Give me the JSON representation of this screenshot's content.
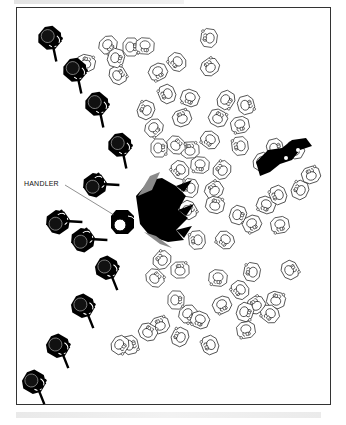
{
  "figure": {
    "labels": {
      "handler": "HANDLER"
    },
    "frame": {
      "stroke": "#333333",
      "background": "#ffffff"
    },
    "colors": {
      "officer_fill": "#000000",
      "crowd_stroke": "#222222",
      "dog_shadow": "#8a8a8a"
    },
    "officers": [
      {
        "x": 50,
        "y": 38,
        "a": 40
      },
      {
        "x": 75,
        "y": 70,
        "a": 40
      },
      {
        "x": 97,
        "y": 104,
        "a": 40
      },
      {
        "x": 120,
        "y": 145,
        "a": 40
      },
      {
        "x": 95,
        "y": 185,
        "a": -35
      },
      {
        "x": 58,
        "y": 222,
        "a": -35
      },
      {
        "x": 83,
        "y": 240,
        "a": -35
      },
      {
        "x": 107,
        "y": 268,
        "a": 30
      },
      {
        "x": 83,
        "y": 306,
        "a": 30
      },
      {
        "x": 58,
        "y": 346,
        "a": 30
      },
      {
        "x": 34,
        "y": 382,
        "a": 30
      }
    ],
    "handler": {
      "x": 122,
      "y": 222
    },
    "crowd": [
      [
        131,
        47
      ],
      [
        108,
        45
      ],
      [
        145,
        46
      ],
      [
        177,
        62
      ],
      [
        209,
        38
      ],
      [
        210,
        67
      ],
      [
        86,
        63
      ],
      [
        118,
        75
      ],
      [
        116,
        58
      ],
      [
        158,
        72
      ],
      [
        190,
        98
      ],
      [
        167,
        94
      ],
      [
        146,
        110
      ],
      [
        182,
        118
      ],
      [
        218,
        118
      ],
      [
        246,
        105
      ],
      [
        226,
        100
      ],
      [
        240,
        125
      ],
      [
        210,
        140
      ],
      [
        240,
        146
      ],
      [
        222,
        170
      ],
      [
        190,
        150
      ],
      [
        176,
        145
      ],
      [
        159,
        148
      ],
      [
        154,
        128
      ],
      [
        200,
        165
      ],
      [
        180,
        170
      ],
      [
        190,
        188
      ],
      [
        214,
        190
      ],
      [
        215,
        205
      ],
      [
        188,
        210
      ],
      [
        238,
        215
      ],
      [
        252,
        224
      ],
      [
        266,
        205
      ],
      [
        278,
        195
      ],
      [
        300,
        190
      ],
      [
        311,
        175
      ],
      [
        295,
        150
      ],
      [
        275,
        148
      ],
      [
        262,
        162
      ],
      [
        280,
        225
      ],
      [
        225,
        240
      ],
      [
        197,
        240
      ],
      [
        162,
        260
      ],
      [
        180,
        270
      ],
      [
        155,
        278
      ],
      [
        176,
        300
      ],
      [
        188,
        314
      ],
      [
        218,
        278
      ],
      [
        240,
        290
      ],
      [
        252,
        272
      ],
      [
        256,
        305
      ],
      [
        276,
        300
      ],
      [
        290,
        270
      ],
      [
        245,
        312
      ],
      [
        222,
        305
      ],
      [
        200,
        320
      ],
      [
        210,
        345
      ],
      [
        180,
        337
      ],
      [
        160,
        325
      ],
      [
        148,
        332
      ],
      [
        130,
        345
      ],
      [
        120,
        345
      ],
      [
        246,
        330
      ],
      [
        270,
        314
      ]
    ]
  }
}
